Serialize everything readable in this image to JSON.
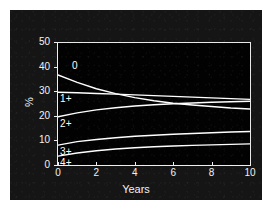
{
  "chart_data": {
    "type": "line",
    "title": "",
    "xlabel": "Years",
    "ylabel": "%",
    "xlim": [
      0,
      10
    ],
    "ylim": [
      0,
      50
    ],
    "grid": false,
    "legend_position": "inline-left",
    "x_ticks": [
      "0",
      "2",
      "4",
      "6",
      "8",
      "10"
    ],
    "y_ticks": [
      "0",
      "10",
      "20",
      "30",
      "40",
      "50"
    ],
    "x": [
      0,
      1,
      2,
      3,
      4,
      5,
      6,
      7,
      8,
      9,
      10
    ],
    "series": [
      {
        "name": "0",
        "label": "0",
        "color": "#ffffff",
        "values": [
          37.0,
          34.0,
          31.4,
          29.4,
          27.8,
          26.5,
          25.5,
          24.8,
          24.2,
          23.6,
          23.2
        ]
      },
      {
        "name": "1+",
        "label": "1+",
        "color": "#ffffff",
        "values": [
          30.0,
          29.8,
          29.5,
          29.2,
          28.9,
          28.6,
          28.3,
          28.0,
          27.7,
          27.4,
          27.1
        ]
      },
      {
        "name": "2+",
        "label": "2+",
        "color": "#ffffff",
        "values": [
          20.0,
          21.6,
          22.8,
          23.7,
          24.4,
          24.9,
          25.3,
          25.6,
          25.9,
          26.1,
          26.3
        ]
      },
      {
        "name": "3+",
        "label": "3+",
        "color": "#ffffff",
        "values": [
          8.5,
          9.9,
          10.8,
          11.5,
          12.1,
          12.5,
          12.9,
          13.2,
          13.5,
          13.8,
          14.0
        ]
      },
      {
        "name": "4+",
        "label": "4+",
        "color": "#ffffff",
        "values": [
          4.0,
          5.3,
          6.2,
          6.9,
          7.4,
          7.8,
          8.1,
          8.4,
          8.6,
          8.8,
          9.0
        ]
      }
    ]
  },
  "figure": {
    "background_color": "#151515",
    "plot_background_color": "#020202",
    "axis_color": "#efefef",
    "text_color": "#f2f2f2"
  }
}
